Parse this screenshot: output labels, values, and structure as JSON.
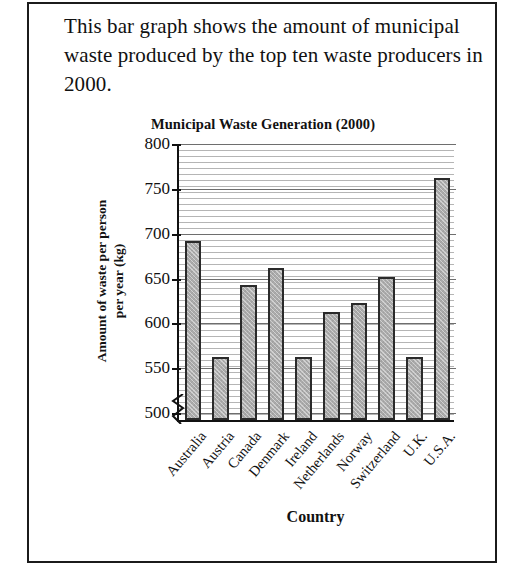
{
  "intro": {
    "text": "This bar graph shows the amount of municipal waste produced by the top ten waste producers in 2000."
  },
  "colors": {
    "bar_fill": "#ababab",
    "bar_border": "#2a2a2a",
    "axis": "#111111",
    "gridline": "#6e6e6e",
    "frame": "#1b1b1b",
    "background": "#ffffff"
  },
  "chart_data": {
    "type": "bar",
    "title": "Municipal Waste Generation (2000)",
    "xlabel": "Country",
    "ylabel": "Amount of waste per person per year (kg)",
    "ylabel_line1": "Amount of waste per person",
    "ylabel_line2": "per year (kg)",
    "categories": [
      "Australia",
      "Austria",
      "Canada",
      "Denmark",
      "Ireland",
      "Netherlands",
      "Norway",
      "Switzerland",
      "U.K.",
      "U.S.A."
    ],
    "values": [
      690,
      560,
      640,
      660,
      560,
      610,
      620,
      650,
      560,
      760
    ],
    "ylim": [
      490,
      800
    ],
    "yticks": [
      500,
      550,
      600,
      650,
      700,
      750,
      800
    ],
    "ytick_labels": [
      "500",
      "550",
      "600",
      "650",
      "700",
      "750",
      "800"
    ],
    "axis_break": true,
    "axis_break_note": "y-axis broken below 500",
    "grid": true,
    "legend": "none"
  }
}
